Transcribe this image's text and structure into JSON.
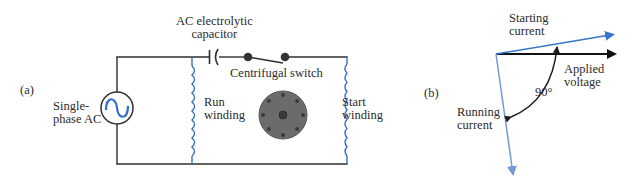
{
  "panel_a": {
    "tag": "(a)",
    "source_label_line1": "Single-",
    "source_label_line2": "phase AC",
    "capacitor_label_line1": "AC electrolytic",
    "capacitor_label_line2": "capacitor",
    "switch_label": "Centrifugal switch",
    "run_winding_line1": "Run",
    "run_winding_line2": "winding",
    "start_winding_line1": "Start",
    "start_winding_line2": "winding"
  },
  "panel_b": {
    "tag": "(b)",
    "starting_current_line1": "Starting",
    "starting_current_line2": "current",
    "applied_voltage_line1": "Applied",
    "applied_voltage_line2": "voltage",
    "running_current_line1": "Running",
    "running_current_line2": "current",
    "angle_label": "90°"
  },
  "colors": {
    "wire": "#2e2e2e",
    "winding": "#3a6fc4",
    "ac_wave": "#2f6fc8",
    "rotor": "#6b6b6b",
    "rotor_dots": "#3a3a3a",
    "starting_current": "#3677c9",
    "running_current": "#6f9bd6",
    "applied_voltage": "#111111"
  }
}
